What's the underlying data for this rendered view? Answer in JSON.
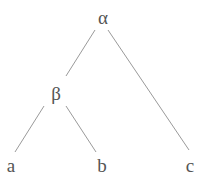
{
  "diagram": {
    "type": "tree",
    "nodes": [
      {
        "id": "alpha",
        "label": "α",
        "x": 103,
        "y": 17
      },
      {
        "id": "beta",
        "label": "β",
        "x": 56,
        "y": 93
      },
      {
        "id": "a",
        "label": "a",
        "x": 11,
        "y": 165
      },
      {
        "id": "b",
        "label": "b",
        "x": 102,
        "y": 165
      },
      {
        "id": "c",
        "label": "c",
        "x": 190,
        "y": 165
      }
    ],
    "edges": [
      {
        "from": "alpha",
        "to": "beta",
        "x1": 95,
        "y1": 30,
        "x2": 66,
        "y2": 76
      },
      {
        "from": "alpha",
        "to": "c",
        "x1": 108,
        "y1": 30,
        "x2": 189,
        "y2": 150
      },
      {
        "from": "beta",
        "to": "a",
        "x1": 44,
        "y1": 106,
        "x2": 15,
        "y2": 152
      },
      {
        "from": "beta",
        "to": "b",
        "x1": 66,
        "y1": 106,
        "x2": 96,
        "y2": 152
      }
    ]
  }
}
